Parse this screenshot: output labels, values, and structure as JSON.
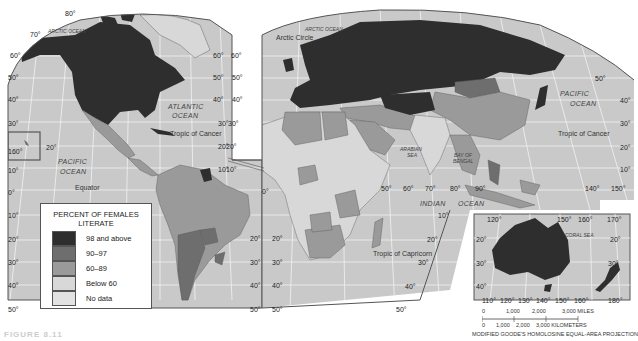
{
  "map": {
    "projection_label": "MODIFIED GOODE'S HOMOLOSINE EQUAL-AREA PROJECTION",
    "figure_label": "FIGURE 8.11",
    "colors": {
      "ocean": "#c9c9c9",
      "graticule": "#f2f2f2",
      "cat_98_above": "#2e2e2e",
      "cat_90_97": "#6e6e6e",
      "cat_60_89": "#9a9a9a",
      "cat_below_60": "#d8d8d8",
      "cat_no_data": "#e2e2e2",
      "border": "#555555"
    }
  },
  "legend": {
    "title_line1": "PERCENT OF FEMALES",
    "title_line2": "LITERATE",
    "items": [
      {
        "label": "98 and above",
        "color": "#2e2e2e"
      },
      {
        "label": "90–97",
        "color": "#6e6e6e"
      },
      {
        "label": "60–89",
        "color": "#9a9a9a"
      },
      {
        "label": "Below 60",
        "color": "#d8d8d8"
      },
      {
        "label": "No data",
        "color": "#e2e2e2"
      }
    ]
  },
  "oceans": {
    "arctic_left": "ARCTIC OCEAN",
    "arctic_right": "ARCTIC OCEAN",
    "atlantic_1": "ATLANTIC",
    "atlantic_2": "OCEAN",
    "pacific_left_1": "PACIFIC",
    "pacific_left_2": "OCEAN",
    "pacific_right_1": "PACIFIC",
    "pacific_right_2": "OCEAN",
    "indian_1": "INDIAN",
    "indian_2": "OCEAN",
    "arabian_1": "ARABIAN",
    "arabian_2": "SEA",
    "bengal_1": "BAY OF",
    "bengal_2": "BENGAL",
    "coral": "CORAL SEA"
  },
  "lines": {
    "arctic_circle": "Arctic Circle",
    "tropic_cancer_left": "Tropic of Cancer",
    "tropic_cancer_right": "Tropic of Cancer",
    "equator": "Equator",
    "tropic_capricorn": "Tropic of Capricorn"
  },
  "degrees": {
    "left_lat": [
      "60°",
      "50°",
      "40°",
      "30°",
      "20°",
      "10°",
      "0°",
      "10°",
      "20°",
      "30°",
      "40°",
      "50°"
    ],
    "top": [
      "80°",
      "70°"
    ],
    "hawaii": "160°",
    "americas_right_lat": [
      "60°",
      "50°",
      "40°",
      "30°",
      "20°",
      "10°",
      "0°",
      "10°",
      "20°",
      "30°",
      "40°",
      "50°"
    ],
    "africa_left_lat": [
      "60°",
      "50°",
      "40°",
      "30°",
      "20°",
      "10°",
      "20°",
      "30°",
      "40°",
      "50°"
    ],
    "equator_lon": [
      "0°",
      "50°",
      "60°",
      "70°",
      "80°",
      "90°",
      "140°",
      "150°"
    ],
    "right_lat": [
      "50°",
      "40°",
      "30°",
      "20°",
      "10°"
    ],
    "indian_lat": [
      "10°",
      "20°",
      "30°",
      "40°",
      "50°"
    ],
    "aus_top": [
      "120°",
      "150°",
      "160°",
      "170°"
    ],
    "aus_bottom": [
      "110°",
      "120°",
      "130°",
      "140°",
      "150°",
      "160°",
      "180°"
    ],
    "aus_left_lat": [
      "20°",
      "30°",
      "40°"
    ],
    "aus_right_lat": [
      "20°",
      "30°"
    ]
  },
  "scale": {
    "miles": [
      "0",
      "1,000",
      "2,000",
      "3,000 MILES"
    ],
    "km": [
      "0",
      "1,000",
      "2,000",
      "3,000 KILOMETERS"
    ]
  }
}
